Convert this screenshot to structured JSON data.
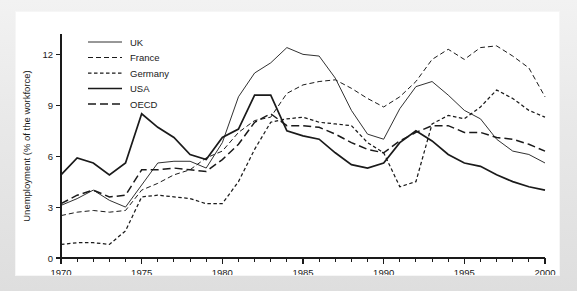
{
  "chart_data": {
    "type": "line",
    "title": "",
    "xlabel": "",
    "ylabel": "Unemployment (% of the workforce)",
    "xlim": [
      1970,
      2000
    ],
    "ylim": [
      0,
      13.2
    ],
    "yticks": [
      0,
      3,
      6,
      9,
      12
    ],
    "ytick_labels": [
      "0",
      "3",
      "6",
      "9",
      "12"
    ],
    "xticks": [
      1970,
      1975,
      1980,
      1985,
      1990,
      1995,
      2000
    ],
    "xtick_labels": [
      "1970",
      "1975",
      "1980",
      "1985",
      "1990",
      "1995",
      "2000"
    ],
    "x_minor_step": 1,
    "grid": false,
    "legend_position": "top-left",
    "x": [
      1970,
      1971,
      1972,
      1973,
      1974,
      1975,
      1976,
      1977,
      1978,
      1979,
      1980,
      1981,
      1982,
      1983,
      1984,
      1985,
      1986,
      1987,
      1988,
      1989,
      1990,
      1991,
      1992,
      1993,
      1994,
      1995,
      1996,
      1997,
      1998,
      1999,
      2000
    ],
    "series": [
      {
        "name": "UK",
        "style": "solid-thin",
        "color": "#1a1a1a",
        "values": [
          3.1,
          3.5,
          4.0,
          3.4,
          3.0,
          4.3,
          5.6,
          5.7,
          5.7,
          5.3,
          6.8,
          9.5,
          10.9,
          11.5,
          12.4,
          12.0,
          11.9,
          10.6,
          8.7,
          7.3,
          7.0,
          8.8,
          10.1,
          10.4,
          9.6,
          8.7,
          8.2,
          7.0,
          6.3,
          6.1,
          5.6
        ]
      },
      {
        "name": "France",
        "style": "dashed",
        "color": "#1a1a1a",
        "values": [
          2.5,
          2.7,
          2.8,
          2.7,
          2.8,
          4.0,
          4.4,
          4.9,
          5.2,
          5.9,
          6.3,
          7.4,
          8.1,
          8.3,
          9.7,
          10.2,
          10.4,
          10.5,
          10.0,
          9.4,
          8.9,
          9.5,
          10.4,
          11.7,
          12.3,
          11.7,
          12.4,
          12.5,
          11.9,
          11.2,
          9.5
        ]
      },
      {
        "name": "Germany",
        "style": "dashed-short",
        "color": "#1a1a1a",
        "values": [
          0.8,
          0.9,
          0.9,
          0.8,
          1.6,
          3.6,
          3.7,
          3.6,
          3.5,
          3.2,
          3.2,
          4.5,
          6.4,
          8.0,
          8.2,
          8.3,
          8.0,
          7.9,
          7.8,
          6.8,
          6.2,
          4.2,
          4.5,
          7.9,
          8.4,
          8.2,
          8.9,
          9.9,
          9.4,
          8.7,
          8.3
        ]
      },
      {
        "name": "USA",
        "style": "solid-thick",
        "color": "#1a1a1a",
        "values": [
          4.9,
          5.9,
          5.6,
          4.9,
          5.6,
          8.5,
          7.7,
          7.1,
          6.1,
          5.8,
          7.1,
          7.6,
          9.6,
          9.6,
          7.5,
          7.2,
          7.0,
          6.2,
          5.5,
          5.3,
          5.6,
          6.8,
          7.5,
          6.9,
          6.1,
          5.6,
          5.4,
          4.9,
          4.5,
          4.2,
          4.0
        ]
      },
      {
        "name": "OECD",
        "style": "dashed-long",
        "color": "#1a1a1a",
        "values": [
          3.2,
          3.7,
          4.0,
          3.6,
          3.7,
          5.2,
          5.2,
          5.3,
          5.2,
          5.1,
          5.8,
          6.7,
          8.0,
          8.5,
          7.8,
          7.8,
          7.7,
          7.3,
          6.8,
          6.4,
          6.2,
          6.9,
          7.4,
          7.8,
          7.8,
          7.4,
          7.4,
          7.1,
          7.0,
          6.7,
          6.3
        ]
      }
    ]
  },
  "legend": {
    "items": [
      {
        "label": "UK"
      },
      {
        "label": "France"
      },
      {
        "label": "Germany"
      },
      {
        "label": "USA"
      },
      {
        "label": "OECD"
      }
    ]
  }
}
